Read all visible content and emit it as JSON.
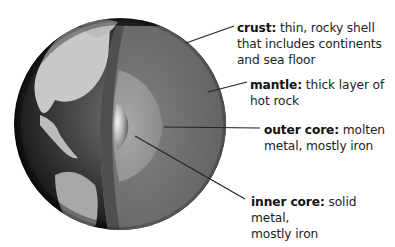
{
  "figure": {
    "colors": {
      "background": "#ffffff",
      "crust_mantle": "#6e6e6e",
      "outer_core": "#9a9a9a",
      "inner_core": "#d4d4d4",
      "leader_line": "#222222",
      "text": "#222222"
    }
  },
  "labels": [
    {
      "term": "crust:",
      "desc_lines": [
        "thin, rocky shell",
        "that includes continents",
        "and sea floor"
      ]
    },
    {
      "term": "mantle:",
      "desc_lines": [
        "thick layer of",
        "hot rock"
      ]
    },
    {
      "term": "outer core:",
      "desc_lines": [
        "molten",
        "metal, mostly iron"
      ]
    },
    {
      "term": "inner core:",
      "desc_lines": [
        "solid metal,",
        "mostly iron"
      ]
    }
  ]
}
